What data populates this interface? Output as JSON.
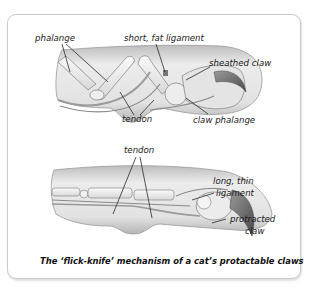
{
  "figure": {
    "caption": "The ‘flick-knife’ mechanism of a cat’s protactable claws",
    "top_view": {
      "state": "retracted",
      "labels": {
        "phalange": "phalange",
        "short_fat_ligament": "short, fat ligament",
        "sheathed_claw": "sheathed claw",
        "tendon": "tendon",
        "claw_phalange": "claw phalange"
      }
    },
    "bottom_view": {
      "state": "protracted",
      "labels": {
        "tendon": "tendon",
        "long_thin_ligament_line1": "long, thin",
        "long_thin_ligament_line2": "ligament",
        "protracted_claw_line1": "protracted",
        "protracted_claw_line2": "claw"
      }
    }
  },
  "colors": {
    "frame_border": "#c9c9c9",
    "paw_fill": "#e6e6e6",
    "paw_shade": "#bdbdbd",
    "bone_fill": "#f2f2f2",
    "outline": "#8a8a8a",
    "claw": "#6f6f6f"
  }
}
